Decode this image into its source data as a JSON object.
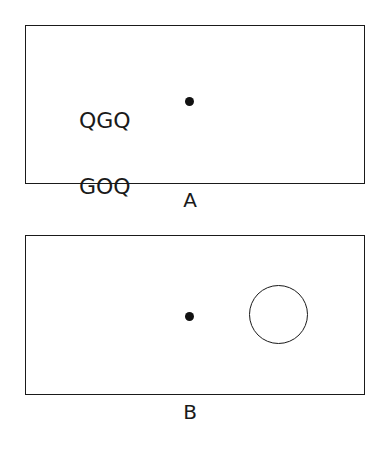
{
  "figure": {
    "background_color": "#ffffff",
    "stroke_color": "#1a1a1a",
    "width": 382,
    "height": 453
  },
  "panels": [
    {
      "id": "A",
      "label": "A",
      "letter_rows": [
        "QGQ",
        "GOQ",
        "QGG"
      ],
      "fixation_dot": {
        "x": 188,
        "y": 100,
        "diameter": 9,
        "color": "#111111"
      },
      "frame": {
        "x": 25,
        "y": 25,
        "width": 340,
        "height": 159
      }
    },
    {
      "id": "B",
      "label": "B",
      "fixation_dot": {
        "x": 188,
        "y": 315,
        "diameter": 9,
        "color": "#111111"
      },
      "target_circle": {
        "x": 277,
        "y": 313,
        "diameter": 59,
        "stroke": "#1a1a1a",
        "fill": "none"
      },
      "frame": {
        "x": 25,
        "y": 235,
        "width": 340,
        "height": 160
      }
    }
  ],
  "letters": {
    "row1": "QGQ",
    "row2": "GOQ",
    "row3": "QGG"
  },
  "labels": {
    "panel_a": "A",
    "panel_b": "B"
  }
}
